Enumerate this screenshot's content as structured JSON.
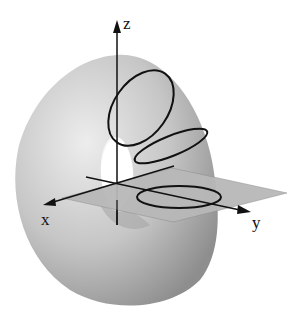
{
  "diagram": {
    "axes": {
      "x_label": "x",
      "y_label": "y",
      "z_label": "z"
    },
    "colors": {
      "torus_light": "#e8e8e8",
      "torus_mid": "#bdbdbd",
      "torus_dark": "#8a8a8a",
      "plane": "#b8b8b8",
      "lines": "#111111",
      "background": "#ffffff"
    }
  }
}
